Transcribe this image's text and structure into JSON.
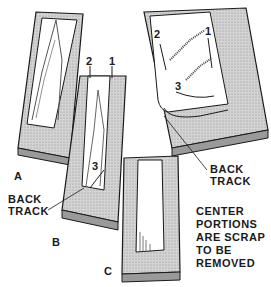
{
  "figure": {
    "panels": [
      {
        "id": "A",
        "label": "A"
      },
      {
        "id": "B",
        "label": "B",
        "step_numbers": [
          "2",
          "1",
          "3"
        ]
      },
      {
        "id": "C",
        "label": "C"
      },
      {
        "id": "D",
        "label": "",
        "step_numbers": [
          "2",
          "1",
          "3"
        ]
      }
    ],
    "callouts": {
      "back_track_left": [
        "BACK",
        "TRACK"
      ],
      "back_track_right": [
        "BACK",
        "TRACK"
      ],
      "note": [
        "CENTER",
        "PORTIONS",
        "ARE SCRAP",
        "TO BE",
        "REMOVED"
      ]
    },
    "colors": {
      "ink": "#1a1a1a",
      "wood_fill": "#bdbdbd",
      "background": "#ffffff"
    }
  }
}
